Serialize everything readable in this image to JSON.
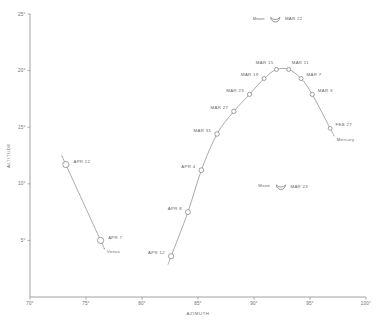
{
  "chart_data": {
    "type": "scatter",
    "title": "",
    "xlabel": "AZIMUTH",
    "ylabel": "ALTITUDE",
    "xlim": [
      70,
      100
    ],
    "ylim": [
      0,
      25
    ],
    "xticks": [
      "70°",
      "75°",
      "80°",
      "85°",
      "90°",
      "95°",
      "100°"
    ],
    "yticks": [
      "25°",
      "20°",
      "15°",
      "10°",
      "5°"
    ],
    "grid": false,
    "legend": "none",
    "series": [
      {
        "name": "Venus",
        "label": "Venus",
        "points": [
          {
            "label": "APR 12",
            "x": 73.2,
            "y": 11.7,
            "r": 3.1
          },
          {
            "label": "APR 7",
            "x": 76.3,
            "y": 5.0,
            "r": 3.1
          }
        ]
      },
      {
        "name": "Mercury",
        "label": "Mercury",
        "points": [
          {
            "label": "APR 12",
            "x": 82.6,
            "y": 3.6,
            "r": 2.6
          },
          {
            "label": "APR 8",
            "x": 84.1,
            "y": 7.5,
            "r": 2.5
          },
          {
            "label": "APR 4",
            "x": 85.3,
            "y": 11.2,
            "r": 2.4
          },
          {
            "label": "MAR 31",
            "x": 86.7,
            "y": 14.4,
            "r": 2.3
          },
          {
            "label": "MAR 27",
            "x": 88.2,
            "y": 16.4,
            "r": 2.2
          },
          {
            "label": "MAR 23",
            "x": 89.6,
            "y": 17.9,
            "r": 2.1
          },
          {
            "label": "MAR 19",
            "x": 90.9,
            "y": 19.3,
            "r": 2.0
          },
          {
            "label": "MAR 15",
            "x": 92.0,
            "y": 20.1,
            "r": 2.0
          },
          {
            "label": "MAR 11",
            "x": 93.1,
            "y": 20.1,
            "r": 2.0
          },
          {
            "label": "MAR 7",
            "x": 94.2,
            "y": 19.3,
            "r": 2.0
          },
          {
            "label": "MAR 3",
            "x": 95.2,
            "y": 17.9,
            "r": 2.1
          },
          {
            "label": "FEB 27",
            "x": 96.8,
            "y": 14.9,
            "r": 1.9
          }
        ]
      }
    ],
    "moons": [
      {
        "name": "Moon",
        "date": "MAR 22",
        "x": 91.9,
        "y": 24.4
      },
      {
        "name": "Moon",
        "date": "MAR 23",
        "x": 92.4,
        "y": 9.6
      }
    ]
  }
}
